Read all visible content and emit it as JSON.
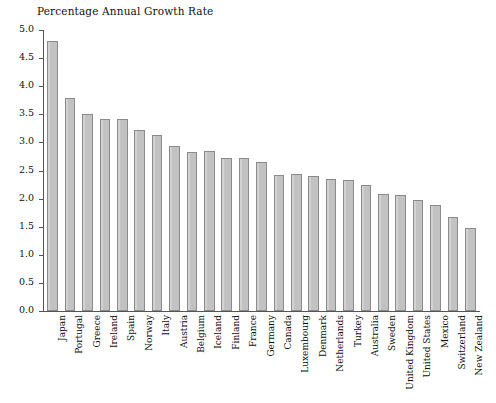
{
  "chart_data": {
    "type": "bar",
    "title": "Percentage Annual Growth Rate",
    "xlabel": "",
    "ylabel": "",
    "ylim": [
      0.0,
      5.0
    ],
    "grid": false,
    "legend": null,
    "ytick_labels": [
      "5.0",
      "4.5",
      "4.0",
      "3.5",
      "3.0",
      "2.5",
      "2.0",
      "1.5",
      "1.0",
      "0.5",
      "0.0"
    ],
    "ytick_values": [
      5.0,
      4.5,
      4.0,
      3.5,
      3.0,
      2.5,
      2.0,
      1.5,
      1.0,
      0.5,
      0.0
    ],
    "bar_color": "#c2c2c2",
    "bar_edge_color": "#8a8a8a",
    "categories": [
      "Japan",
      "Portugal",
      "Greece",
      "Ireland",
      "Spain",
      "Norway",
      "Italy",
      "Austria",
      "Belgium",
      "Iceland",
      "Finland",
      "France",
      "Germany",
      "Canada",
      "Luxembourg",
      "Denmark",
      "Netherlands",
      "Turkey",
      "Australia",
      "Sweden",
      "United Kingdom",
      "United States",
      "Mexico",
      "Switzerland",
      "New Zealand"
    ],
    "values": [
      4.8,
      3.79,
      3.5,
      3.42,
      3.42,
      3.22,
      3.13,
      2.93,
      2.83,
      2.84,
      2.73,
      2.73,
      2.65,
      2.42,
      2.43,
      2.4,
      2.35,
      2.34,
      2.25,
      2.08,
      2.07,
      1.97,
      1.88,
      1.68,
      1.47
    ]
  }
}
